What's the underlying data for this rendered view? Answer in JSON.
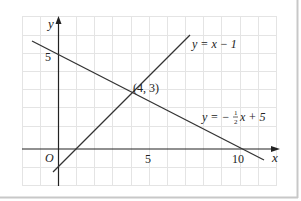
{
  "diagram": {
    "type": "coordinate-graph",
    "axes": {
      "x_label": "x",
      "y_label": "y",
      "origin_label": "O",
      "x_ticks": [
        {
          "value": 5,
          "label": "5"
        },
        {
          "value": 10,
          "label": "10"
        }
      ],
      "y_ticks": [
        {
          "value": 5,
          "label": "5"
        }
      ]
    },
    "lines": [
      {
        "equation": "y = x − 1",
        "label": "y = x − 1",
        "slope": 1,
        "intercept": -1
      },
      {
        "equation": "y = −½x + 5",
        "label_prefix": "y = −",
        "label_frac_num": "1",
        "label_frac_den": "2",
        "label_suffix": "x + 5",
        "slope": -0.5,
        "intercept": 5
      }
    ],
    "intersection": {
      "x": 4,
      "y": 3,
      "label": "(4, 3)"
    },
    "colors": {
      "grid": "#e2e2e2",
      "axis": "#222222",
      "line": "#333333",
      "border": "#c8c8c8"
    }
  }
}
